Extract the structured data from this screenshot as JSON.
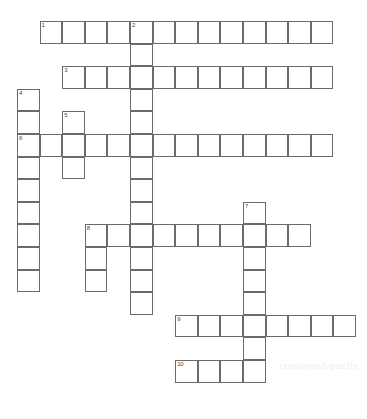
{
  "puzzle": {
    "title": "Crossword Puzzle Grid",
    "cell_size": 22.6,
    "origin_x": 17,
    "origin_y": 21,
    "grid_cols": 15,
    "grid_rows": 17,
    "watermark_text": "crossword-puzzle",
    "colors": {
      "background": "#ffffff",
      "cell_border": "#6b6b6b",
      "number_text": "#444444",
      "watermark": "#efefef"
    },
    "entries": [
      {
        "number": "1",
        "direction": "across",
        "col": 1,
        "row": 0,
        "length": 13
      },
      {
        "number": "2",
        "direction": "down",
        "col": 5,
        "row": 0,
        "length": 13
      },
      {
        "number": "3",
        "direction": "across",
        "col": 2,
        "row": 2,
        "length": 12
      },
      {
        "number": "4",
        "direction": "down",
        "col": 0,
        "row": 3,
        "length": 9
      },
      {
        "number": "5",
        "direction": "down",
        "col": 2,
        "row": 4,
        "length": 3
      },
      {
        "number": "6",
        "direction": "across",
        "col": 0,
        "row": 5,
        "length": 14
      },
      {
        "number": "7",
        "direction": "down",
        "col": 10,
        "row": 8,
        "length": 8
      },
      {
        "number": "8",
        "direction": "across",
        "col": 3,
        "row": 9,
        "length": 10
      },
      {
        "number": "8d",
        "direction": "down",
        "col": 3,
        "row": 9,
        "length": 3
      },
      {
        "number": "9",
        "direction": "across",
        "col": 7,
        "row": 13,
        "length": 8
      },
      {
        "number": "10",
        "direction": "across",
        "col": 7,
        "row": 15,
        "length": 4
      }
    ],
    "numbered_cells": [
      {
        "label": "1",
        "col": 1,
        "row": 0
      },
      {
        "label": "2",
        "col": 5,
        "row": 0
      },
      {
        "label": "3",
        "col": 2,
        "row": 2
      },
      {
        "label": "4",
        "col": 0,
        "row": 3
      },
      {
        "label": "5",
        "col": 2,
        "row": 4
      },
      {
        "label": "6",
        "col": 0,
        "row": 5
      },
      {
        "label": "7",
        "col": 10,
        "row": 8
      },
      {
        "label": "8",
        "col": 3,
        "row": 9
      },
      {
        "label": "9",
        "col": 7,
        "row": 13
      },
      {
        "label": "10",
        "col": 7,
        "row": 15
      }
    ]
  }
}
